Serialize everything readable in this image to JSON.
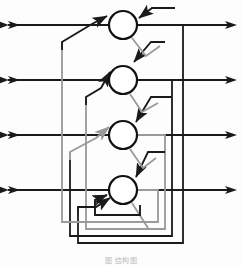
{
  "figure": {
    "caption": "图                                           结构图",
    "background_color": "#fdfdfd",
    "line_color_primary": "#1a1a1a",
    "line_color_secondary": "#9a9a9a",
    "neuron_fill": "#ffffff",
    "neuron_stroke": "#111111"
  },
  "geometry": {
    "width": 242,
    "height": 267,
    "neuron_radius": 14,
    "neuron_center_x": 123,
    "input_start_x": 8,
    "output_end_x": 237,
    "left_bus_x": [
      62,
      70,
      78,
      86
    ],
    "right_bus_x": [
      158,
      165,
      172,
      183
    ],
    "bottom_bus_y": [
      222,
      229,
      236,
      243
    ]
  },
  "neurons": [
    {
      "id": "neuron-1",
      "label": "1",
      "cx": 123,
      "cy": 25
    },
    {
      "id": "neuron-2",
      "label": "2",
      "cx": 123,
      "cy": 80
    },
    {
      "id": "neuron-3",
      "label": "3",
      "cx": 123,
      "cy": 135
    },
    {
      "id": "neuron-4",
      "label": "4",
      "cx": 123,
      "cy": 190
    }
  ],
  "inputs": [
    {
      "id": "input-1",
      "y": 25
    },
    {
      "id": "input-2",
      "y": 80
    },
    {
      "id": "input-3",
      "y": 135
    },
    {
      "id": "input-4",
      "y": 190
    }
  ],
  "outputs": [
    {
      "id": "output-1",
      "y": 25
    },
    {
      "id": "output-2",
      "y": 80
    },
    {
      "id": "output-3",
      "y": 135
    },
    {
      "id": "output-4",
      "y": 190
    }
  ],
  "feedback_loops": [
    {
      "id": "loop-1",
      "source": "neuron-1",
      "color": "#1a1a1a",
      "style": "solid"
    },
    {
      "id": "loop-2",
      "source": "neuron-2",
      "color": "#1a1a1a",
      "style": "solid"
    },
    {
      "id": "loop-3",
      "source": "neuron-3",
      "color": "#9a9a9a",
      "style": "solid"
    },
    {
      "id": "loop-4",
      "source": "neuron-4",
      "color": "#9a9a9a",
      "style": "solid"
    }
  ]
}
